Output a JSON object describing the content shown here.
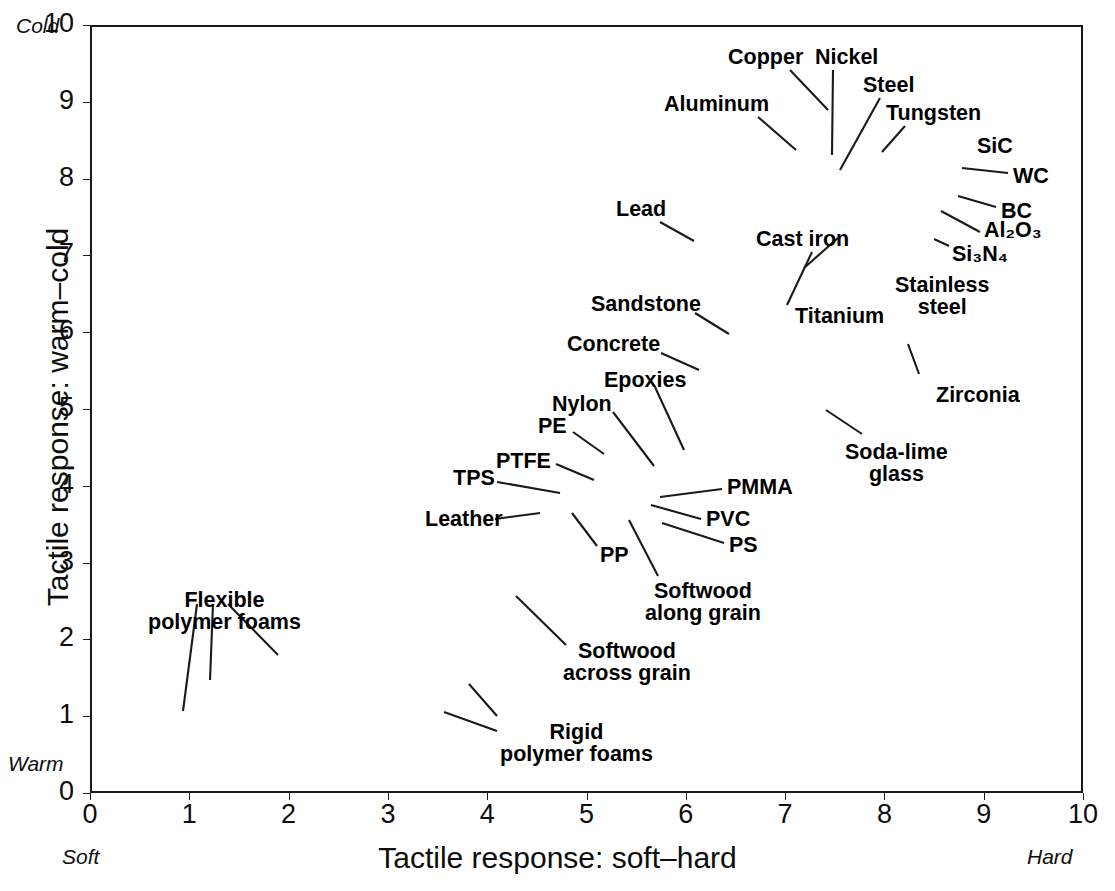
{
  "chart_data": {
    "type": "scatter",
    "title": "",
    "xlabel": "Tactile response: soft–hard",
    "ylabel": "Tactile response: warm–cold",
    "xlim": [
      0,
      10
    ],
    "ylim": [
      0,
      10
    ],
    "xticks": [
      "0",
      "1",
      "2",
      "3",
      "4",
      "5",
      "6",
      "7",
      "8",
      "9",
      "10"
    ],
    "yticks": [
      "0",
      "1",
      "2",
      "3",
      "4",
      "5",
      "6",
      "7",
      "8",
      "9",
      "10"
    ],
    "grid": true,
    "legend": "none",
    "axis_end_notes": {
      "y_top": "Cold",
      "y_bottom": "Warm",
      "x_left": "Soft",
      "x_right": "Hard"
    },
    "marker_shape": "ellipse-bubble",
    "series": [
      {
        "name": "Flexible polymer foams",
        "label": "Flexible\npolymer foams",
        "members": [
          {
            "x": 0.62,
            "y": 0.55,
            "w": 1.15,
            "h": 0.72,
            "rot": -4,
            "fill": "#dcdcdc"
          },
          {
            "x": 1.15,
            "y": 1.12,
            "w": 1.35,
            "h": 0.62,
            "rot": -8,
            "fill": "#dcdcdc"
          },
          {
            "x": 1.75,
            "y": 1.6,
            "w": 1.3,
            "h": 0.72,
            "rot": -9,
            "fill": "#dcdcdc"
          }
        ]
      },
      {
        "name": "Rigid polymer foams",
        "label": "Rigid\npolymer foams",
        "members": [
          {
            "x": 2.98,
            "y": 0.62,
            "w": 0.95,
            "h": 0.68,
            "rot": 0,
            "fill": "#dcdcdc"
          },
          {
            "x": 3.52,
            "y": 1.15,
            "w": 0.82,
            "h": 0.62,
            "rot": 0,
            "fill": "#dcdcdc"
          }
        ]
      },
      {
        "name": "Softwood across grain",
        "label": "Softwood\nacross grain",
        "members": [
          {
            "x": 4.08,
            "y": 1.93,
            "w": 0.9,
            "h": 1.05,
            "rot": 0,
            "fill": "#dcdcdc"
          }
        ]
      },
      {
        "name": "PP",
        "label": "PP",
        "members": [
          {
            "x": 4.86,
            "y": 3.2,
            "w": 0.3,
            "h": 0.62,
            "rot": 0,
            "fill": "#8d8d8d"
          }
        ]
      },
      {
        "name": "Leather",
        "label": "Leather",
        "members": [
          {
            "x": 5.25,
            "y": 3.68,
            "w": 1.0,
            "h": 0.3,
            "rot": -6,
            "fill": "#8d8d8d"
          }
        ]
      },
      {
        "name": "TPS",
        "label": "TPS",
        "members": [
          {
            "x": 5.32,
            "y": 4.12,
            "w": 0.72,
            "h": 0.25,
            "rot": -7,
            "fill": "#9e9e9e"
          },
          {
            "x": 5.68,
            "y": 3.92,
            "w": 1.15,
            "h": 0.55,
            "rot": -3,
            "fill": "#cfcfcf"
          }
        ]
      },
      {
        "name": "PTFE",
        "label": "PTFE",
        "members": [
          {
            "x": 5.54,
            "y": 4.3,
            "w": 0.22,
            "h": 0.22,
            "rot": 0,
            "fill": "#d5d5d5"
          }
        ]
      },
      {
        "name": "PE",
        "label": "PE",
        "members": [
          {
            "x": 5.76,
            "y": 4.42,
            "w": 0.38,
            "h": 0.18,
            "rot": -6,
            "fill": "#cfcfcf"
          },
          {
            "x": 5.98,
            "y": 4.12,
            "w": 0.72,
            "h": 0.62,
            "rot": -4,
            "fill": "#c4c4c4"
          }
        ]
      },
      {
        "name": "Nylon",
        "label": "Nylon",
        "members": [
          {
            "x": 6.02,
            "y": 3.9,
            "w": 0.85,
            "h": 0.7,
            "rot": -5,
            "fill": "#b5b5b5"
          },
          {
            "x": 5.9,
            "y": 3.62,
            "w": 0.4,
            "h": 0.22,
            "rot": 0,
            "fill": "#d0d0d0"
          }
        ]
      },
      {
        "name": "Epoxies",
        "label": "Epoxies",
        "members": [
          {
            "x": 6.2,
            "y": 4.48,
            "w": 0.32,
            "h": 0.7,
            "rot": 0,
            "fill": "#d3d3d3"
          },
          {
            "x": 6.22,
            "y": 4.02,
            "w": 0.28,
            "h": 0.62,
            "rot": 0,
            "fill": "#cdcdcd"
          }
        ]
      },
      {
        "name": "PMMA",
        "label": "PMMA",
        "members": [
          {
            "x": 6.3,
            "y": 4.0,
            "w": 0.22,
            "h": 0.55,
            "rot": 0,
            "fill": "#c8c8c8"
          },
          {
            "x": 6.42,
            "y": 3.92,
            "w": 0.2,
            "h": 0.18,
            "rot": 0,
            "fill": "#bfbfbf"
          }
        ]
      },
      {
        "name": "PVC",
        "label": "PVC",
        "members": [
          {
            "x": 6.26,
            "y": 3.7,
            "w": 0.26,
            "h": 0.48,
            "rot": 0,
            "fill": "#cccccc"
          }
        ]
      },
      {
        "name": "PS",
        "label": "PS",
        "members": [
          {
            "x": 6.48,
            "y": 3.62,
            "w": 1.1,
            "h": 0.42,
            "rot": -3,
            "fill": "#9a9a9a"
          },
          {
            "x": 6.18,
            "y": 3.48,
            "w": 0.3,
            "h": 0.4,
            "rot": 0,
            "fill": "#d6d6d6"
          }
        ]
      },
      {
        "name": "Softwood along grain",
        "label": "Softwood\nalong grain",
        "members": [
          {
            "x": 6.02,
            "y": 3.52,
            "w": 0.28,
            "h": 0.62,
            "rot": 0,
            "fill": "#9d9d9d"
          }
        ]
      },
      {
        "name": "dark polymers",
        "label": "",
        "members": [
          {
            "x": 6.42,
            "y": 4.46,
            "w": 0.34,
            "h": 0.36,
            "rot": 0,
            "fill": "#2b2b2b"
          },
          {
            "x": 6.62,
            "y": 4.44,
            "w": 0.32,
            "h": 0.34,
            "rot": 0,
            "fill": "#212121"
          },
          {
            "x": 6.82,
            "y": 4.48,
            "w": 0.28,
            "h": 0.3,
            "rot": 0,
            "fill": "#2f2f2f"
          },
          {
            "x": 6.96,
            "y": 4.38,
            "w": 0.2,
            "h": 0.2,
            "rot": 0,
            "fill": "#8f8f8f"
          },
          {
            "x": 7.1,
            "y": 4.46,
            "w": 0.34,
            "h": 0.34,
            "rot": 0,
            "fill": "#b7b7b7"
          }
        ]
      },
      {
        "name": "Concrete",
        "label": "Concrete",
        "members": [
          {
            "x": 6.12,
            "y": 5.42,
            "w": 0.4,
            "h": 1.3,
            "rot": 0,
            "fill": "#bdbdbd"
          }
        ]
      },
      {
        "name": "Sandstone",
        "label": "Sandstone",
        "members": [
          {
            "x": 6.4,
            "y": 5.7,
            "w": 0.92,
            "h": 1.5,
            "rot": 0,
            "fill": "#bfbfbf"
          },
          {
            "x": 6.42,
            "y": 5.22,
            "w": 0.92,
            "h": 0.9,
            "rot": 0,
            "fill": "#b0b0b0"
          },
          {
            "x": 6.3,
            "y": 4.72,
            "w": 0.22,
            "h": 0.25,
            "rot": 0,
            "fill": "#c3c3c3"
          },
          {
            "x": 6.78,
            "y": 6.3,
            "w": 0.24,
            "h": 0.2,
            "rot": 0,
            "fill": "#c6c6c6"
          },
          {
            "x": 6.84,
            "y": 5.72,
            "w": 0.3,
            "h": 0.25,
            "rot": 0,
            "fill": "#c6c6c6"
          }
        ]
      },
      {
        "name": "dark mid blobs",
        "label": "",
        "members": [
          {
            "x": 6.82,
            "y": 5.22,
            "w": 0.38,
            "h": 0.52,
            "rot": 0,
            "fill": "#2a2a2a"
          },
          {
            "x": 7.0,
            "y": 5.3,
            "w": 0.32,
            "h": 0.48,
            "rot": 0,
            "fill": "#b5b5b5"
          },
          {
            "x": 7.2,
            "y": 5.0,
            "w": 0.14,
            "h": 0.24,
            "rot": 0,
            "fill": "#303030"
          }
        ]
      },
      {
        "name": "Soda-lime glass",
        "label": "Soda-lime\nglass",
        "members": [
          {
            "x": 7.64,
            "y": 5.3,
            "w": 0.22,
            "h": 0.52,
            "rot": 0,
            "fill": "#2e2e2e"
          },
          {
            "x": 7.6,
            "y": 4.92,
            "w": 0.18,
            "h": 0.4,
            "rot": 0,
            "fill": "#2c2c2c"
          },
          {
            "x": 7.72,
            "y": 4.98,
            "w": 0.3,
            "h": 0.12,
            "rot": 0,
            "fill": "#3a3a3a"
          }
        ]
      },
      {
        "name": "Zirconia",
        "label": "Zirconia",
        "members": [
          {
            "x": 8.2,
            "y": 5.95,
            "w": 0.2,
            "h": 0.62,
            "rot": 0,
            "fill": "#dedede"
          }
        ]
      },
      {
        "name": "Lead",
        "label": "Lead",
        "members": [
          {
            "x": 6.08,
            "y": 7.06,
            "w": 0.42,
            "h": 0.58,
            "rot": 0,
            "fill": "#9a9a9a"
          },
          {
            "x": 5.82,
            "y": 7.12,
            "w": 0.3,
            "h": 0.12,
            "rot": 0,
            "fill": "#8a8a8a"
          }
        ]
      },
      {
        "name": "Titanium",
        "label": "Titanium",
        "members": [
          {
            "x": 7.34,
            "y": 7.1,
            "w": 0.4,
            "h": 0.72,
            "rot": 0,
            "fill": "#b0b0b0"
          },
          {
            "x": 7.3,
            "y": 6.7,
            "w": 0.2,
            "h": 0.55,
            "rot": -5,
            "fill": "#8c8c8c"
          },
          {
            "x": 7.24,
            "y": 6.92,
            "w": 0.14,
            "h": 0.45,
            "rot": -4,
            "fill": "#7f7f7f"
          }
        ]
      },
      {
        "name": "Stainless steel",
        "label": "Stainless\nsteel",
        "members": [
          {
            "x": 7.38,
            "y": 7.52,
            "w": 0.46,
            "h": 0.58,
            "rot": 0,
            "fill": "#a5a5a5"
          },
          {
            "x": 7.2,
            "y": 7.5,
            "w": 0.22,
            "h": 0.45,
            "rot": 0,
            "fill": "#9d9d9d"
          }
        ]
      },
      {
        "name": "Cast iron",
        "label": "Cast iron",
        "members": [
          {
            "x": 6.95,
            "y": 7.85,
            "w": 0.82,
            "h": 0.3,
            "rot": -2,
            "fill": "#8b8b8b"
          },
          {
            "x": 6.62,
            "y": 7.8,
            "w": 0.35,
            "h": 0.55,
            "rot": 0,
            "fill": "#9b9b9b"
          },
          {
            "x": 6.62,
            "y": 7.02,
            "w": 0.05,
            "h": 0.08,
            "rot": 0,
            "fill": "#8f8f8f"
          }
        ]
      },
      {
        "name": "Aluminum",
        "label": "Aluminum",
        "members": [
          {
            "x": 6.62,
            "y": 8.3,
            "w": 0.52,
            "h": 0.55,
            "rot": 0,
            "fill": "#a3a3a3"
          },
          {
            "x": 6.54,
            "y": 7.55,
            "w": 0.38,
            "h": 0.72,
            "rot": 0,
            "fill": "#8a8a8a"
          },
          {
            "x": 6.68,
            "y": 8.02,
            "w": 0.82,
            "h": 0.25,
            "rot": 0,
            "fill": "#949494"
          }
        ]
      },
      {
        "name": "Copper",
        "label": "Copper",
        "members": [
          {
            "x": 7.02,
            "y": 8.78,
            "w": 0.52,
            "h": 0.6,
            "rot": 0,
            "fill": "#a0a0a0"
          }
        ]
      },
      {
        "name": "Nickel",
        "label": "Nickel",
        "members": [
          {
            "x": 6.92,
            "y": 8.18,
            "w": 0.34,
            "h": 0.4,
            "rot": 0,
            "fill": "#1e1e1e"
          }
        ]
      },
      {
        "name": "Steel",
        "label": "Steel",
        "members": [
          {
            "x": 7.22,
            "y": 8.05,
            "w": 0.62,
            "h": 0.3,
            "rot": 0,
            "fill": "#8d8d8d"
          },
          {
            "x": 7.4,
            "y": 7.8,
            "w": 0.95,
            "h": 0.32,
            "rot": -2,
            "fill": "#7b7b7b"
          },
          {
            "x": 7.02,
            "y": 7.78,
            "w": 0.28,
            "h": 0.16,
            "rot": 0,
            "fill": "#707070"
          },
          {
            "x": 7.18,
            "y": 7.52,
            "w": 0.42,
            "h": 0.36,
            "rot": 0,
            "fill": "#9a9a9a"
          },
          {
            "x": 6.98,
            "y": 7.55,
            "w": 0.34,
            "h": 0.3,
            "rot": 0,
            "fill": "#939393"
          }
        ]
      },
      {
        "name": "Tungsten",
        "label": "Tungsten",
        "members": [
          {
            "x": 7.6,
            "y": 8.18,
            "w": 0.36,
            "h": 0.32,
            "rot": 0,
            "fill": "#adadad"
          },
          {
            "x": 7.62,
            "y": 7.92,
            "w": 0.1,
            "h": 0.1,
            "rot": 0,
            "fill": "#c8c8c8"
          },
          {
            "x": 7.92,
            "y": 8.42,
            "w": 0.16,
            "h": 0.38,
            "rot": 0,
            "fill": "#d4d4d4"
          }
        ]
      },
      {
        "name": "SiC",
        "label": "SiC",
        "members": [
          {
            "x": 8.62,
            "y": 8.18,
            "w": 0.14,
            "h": 0.48,
            "rot": 0,
            "fill": "#cfcfcf"
          }
        ]
      },
      {
        "name": "WC",
        "label": "WC",
        "members": [
          {
            "x": 8.8,
            "y": 8.28,
            "w": 0.2,
            "h": 0.5,
            "rot": 0,
            "fill": "#dcdcdc"
          }
        ]
      },
      {
        "name": "BC",
        "label": "BC",
        "members": [
          {
            "x": 8.78,
            "y": 7.78,
            "w": 0.14,
            "h": 0.9,
            "rot": 0,
            "fill": "#d6d6d6"
          }
        ]
      },
      {
        "name": "Al2O3",
        "label": "Al₂O₃",
        "members": [
          {
            "x": 8.48,
            "y": 7.48,
            "w": 0.26,
            "h": 0.34,
            "rot": 0,
            "fill": "#d8d8d8"
          }
        ]
      },
      {
        "name": "Si3N4",
        "label": "Si₃N₄",
        "members": [
          {
            "x": 8.44,
            "y": 7.12,
            "w": 0.14,
            "h": 0.28,
            "rot": 0,
            "fill": "#dbdbdb"
          }
        ]
      }
    ],
    "annotations": [
      {
        "text": "Copper",
        "x": 728,
        "y": 46
      },
      {
        "text": "Nickel",
        "x": 815,
        "y": 46
      },
      {
        "text": "Steel",
        "x": 863,
        "y": 74
      },
      {
        "text": "Aluminum",
        "x": 664,
        "y": 93
      },
      {
        "text": "Tungsten",
        "x": 886,
        "y": 102
      },
      {
        "text": "SiC",
        "x": 977,
        "y": 135
      },
      {
        "text": "WC",
        "x": 1013,
        "y": 165
      },
      {
        "text": "BC",
        "x": 1001,
        "y": 200
      },
      {
        "text": "Al₂O₃",
        "x": 984,
        "y": 219
      },
      {
        "text": "Si₃N₄",
        "x": 952,
        "y": 243
      },
      {
        "text": "Lead",
        "x": 616,
        "y": 198
      },
      {
        "text": "Cast iron",
        "x": 756,
        "y": 228
      },
      {
        "text": "Stainless\nsteel",
        "x": 895,
        "y": 274
      },
      {
        "text": "Sandstone",
        "x": 591,
        "y": 293
      },
      {
        "text": "Titanium",
        "x": 795,
        "y": 305
      },
      {
        "text": "Concrete",
        "x": 567,
        "y": 333
      },
      {
        "text": "Epoxies",
        "x": 604,
        "y": 369
      },
      {
        "text": "Zirconia",
        "x": 936,
        "y": 384
      },
      {
        "text": "Nylon",
        "x": 552,
        "y": 393
      },
      {
        "text": "PE",
        "x": 538,
        "y": 415
      },
      {
        "text": "Soda-lime\nglass",
        "x": 845,
        "y": 441
      },
      {
        "text": "PTFE",
        "x": 496,
        "y": 450
      },
      {
        "text": "TPS",
        "x": 453,
        "y": 467
      },
      {
        "text": "PMMA",
        "x": 727,
        "y": 476
      },
      {
        "text": "Leather",
        "x": 425,
        "y": 508
      },
      {
        "text": "PVC",
        "x": 706,
        "y": 508
      },
      {
        "text": "PS",
        "x": 729,
        "y": 534
      },
      {
        "text": "PP",
        "x": 600,
        "y": 544
      },
      {
        "text": "Softwood\nalong grain",
        "x": 645,
        "y": 580
      },
      {
        "text": "Flexible\npolymer foams",
        "x": 148,
        "y": 589
      },
      {
        "text": "Softwood\nacross grain",
        "x": 563,
        "y": 640
      },
      {
        "text": "Rigid\npolymer foams",
        "x": 500,
        "y": 721
      }
    ]
  },
  "axes": {
    "x_title": "Tactile response: soft–hard",
    "y_title": "Tactile response: warm–cold",
    "x_ticks": [
      "0",
      "1",
      "2",
      "3",
      "4",
      "5",
      "6",
      "7",
      "8",
      "9",
      "10"
    ],
    "y_ticks": [
      "0",
      "1",
      "2",
      "3",
      "4",
      "5",
      "6",
      "7",
      "8",
      "9",
      "10"
    ],
    "cold_note": "Cold",
    "warm_note": "Warm",
    "soft_note": "Soft",
    "hard_note": "Hard"
  },
  "colors": {
    "frame": "#1a1a1a",
    "grid": "#9b9b9b",
    "bubble_stroke": "#3c3c3c",
    "text": "#0d0d0d",
    "background": "#ffffff"
  }
}
